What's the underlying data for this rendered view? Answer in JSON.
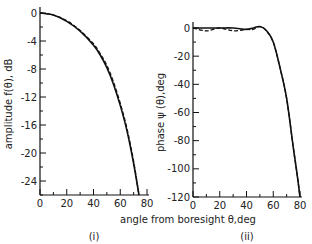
{
  "chart_data": [
    {
      "type": "line",
      "panel_label": "(i)",
      "title": "",
      "xlabel": "angle from boresight θ,deg",
      "ylabel": "amplitude f(θ), dB",
      "xlim": [
        0,
        80
      ],
      "ylim": [
        -26,
        0
      ],
      "xticks": [
        0,
        20,
        40,
        60,
        80
      ],
      "yticks": [
        0,
        -4,
        -8,
        -12,
        -16,
        -20,
        -24
      ],
      "grid": false,
      "legend": null,
      "x": [
        0,
        10,
        20,
        30,
        40,
        45,
        50,
        55,
        60,
        65,
        70,
        74
      ],
      "series": [
        {
          "name": "solid",
          "style": "solid",
          "values": [
            0,
            -0.3,
            -1.2,
            -2.6,
            -4.6,
            -6.0,
            -7.8,
            -10.2,
            -13.2,
            -16.8,
            -21.5,
            -26
          ]
        },
        {
          "name": "dashed",
          "style": "dashed",
          "values": [
            0,
            -0.3,
            -1.1,
            -2.5,
            -4.4,
            -5.8,
            -7.5,
            -9.9,
            -12.9,
            -16.5,
            -21.2,
            -26
          ]
        }
      ]
    },
    {
      "type": "line",
      "panel_label": "(ii)",
      "title": "",
      "xlabel": "angle from boresight θ,deg",
      "ylabel": "phase ψ (θ),deg",
      "xlim": [
        0,
        80
      ],
      "ylim": [
        -120,
        0
      ],
      "xticks": [
        0,
        20,
        40,
        60,
        80
      ],
      "yticks": [
        0,
        -20,
        -40,
        -60,
        -80,
        -100,
        -120
      ],
      "grid": false,
      "legend": null,
      "x": [
        0,
        10,
        20,
        30,
        40,
        45,
        50,
        55,
        60,
        65,
        70,
        75,
        78,
        80
      ],
      "series": [
        {
          "name": "solid",
          "style": "solid",
          "values": [
            0,
            0,
            0,
            0,
            -1,
            0,
            1,
            -2,
            -10,
            -28,
            -50,
            -85,
            -105,
            -120
          ]
        },
        {
          "name": "dashed",
          "style": "dashed",
          "values": [
            0,
            -2,
            0,
            -2,
            -1,
            -1,
            1,
            -2,
            -10,
            -28,
            -50,
            -85,
            -105,
            -120
          ]
        }
      ]
    }
  ],
  "labels": {
    "shared_xlabel": "angle from boresight θ,deg",
    "left_ylabel": "amplitude f(θ), dB",
    "right_ylabel": "phase ψ (θ),deg",
    "left_panel": "(i)",
    "right_panel": "(ii)"
  }
}
